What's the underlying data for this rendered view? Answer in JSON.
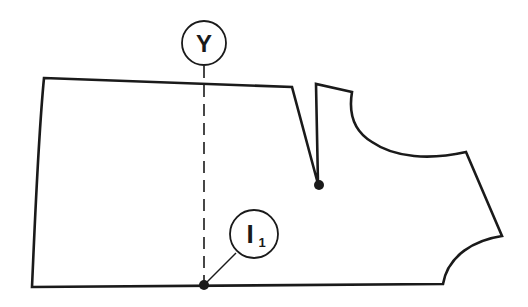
{
  "diagram": {
    "type": "pattern-piece",
    "stroke_color": "#1a1a1a",
    "background": "#ffffff",
    "labels": {
      "top_marker": {
        "text": "Y"
      },
      "bottom_marker": {
        "main": "I",
        "subscript": "1"
      }
    },
    "features": [
      "pattern outline",
      "waist dart with apex point",
      "dashed vertical guide line",
      "marker point on hem"
    ]
  }
}
